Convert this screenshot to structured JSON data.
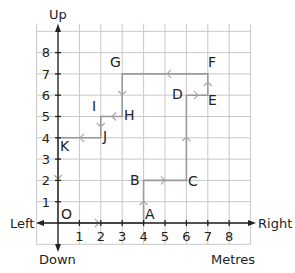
{
  "diagram": {
    "type": "coordinate-grid-route",
    "units_label": "Metres",
    "directions": {
      "up": "Up",
      "down": "Down",
      "left": "Left",
      "right": "Right"
    },
    "origin_label": "O",
    "x_ticks": [
      "1",
      "2",
      "3",
      "4",
      "5",
      "6",
      "7",
      "8"
    ],
    "y_ticks": [
      "1",
      "2",
      "3",
      "4",
      "5",
      "6",
      "7",
      "8"
    ],
    "grid": {
      "x_min": -1,
      "x_max": 9,
      "y_min": -1,
      "y_max": 9
    },
    "points": [
      {
        "label": "O",
        "x": 0,
        "y": 0
      },
      {
        "label": "A",
        "x": 4,
        "y": 0
      },
      {
        "label": "B",
        "x": 4,
        "y": 2
      },
      {
        "label": "C",
        "x": 6,
        "y": 2
      },
      {
        "label": "D",
        "x": 6,
        "y": 6
      },
      {
        "label": "E",
        "x": 7,
        "y": 6
      },
      {
        "label": "F",
        "x": 7,
        "y": 7
      },
      {
        "label": "G",
        "x": 3,
        "y": 7
      },
      {
        "label": "H",
        "x": 3,
        "y": 5
      },
      {
        "label": "I",
        "x": 2,
        "y": 5
      },
      {
        "label": "J",
        "x": 2,
        "y": 4
      },
      {
        "label": "K",
        "x": 0,
        "y": 4
      }
    ],
    "route": [
      "O",
      "A",
      "B",
      "C",
      "D",
      "E",
      "F",
      "G",
      "H",
      "I",
      "J",
      "K",
      "O"
    ],
    "colors": {
      "grid": "#c8c8c8",
      "axis": "#222222",
      "route": "#9a9a9a",
      "text": "#222222",
      "background": "#ffffff"
    }
  }
}
